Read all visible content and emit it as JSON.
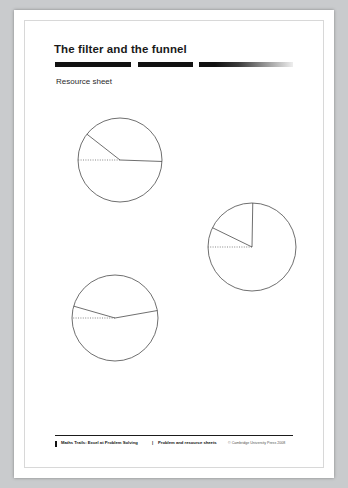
{
  "page": {
    "title": "The filter and the funnel",
    "subtitle": "Resource sheet"
  },
  "footer": {
    "left": "Maths Trails: Excel at Problem Solving",
    "separator": "|",
    "middle": "Problem and resource sheets",
    "right": "© Cambridge University Press 2008"
  },
  "diagram": {
    "stroke_color": "#4a4a4a",
    "dotted_color": "#555555",
    "circles": [
      {
        "name": "circle-top-left",
        "cx": 106,
        "cy": 150,
        "r": 42,
        "radius_lines": [
          {
            "name": "radius-upper-left",
            "angle_deg": 218,
            "style": "solid"
          },
          {
            "name": "radius-right",
            "angle_deg": 2,
            "style": "solid"
          },
          {
            "name": "radius-horizontal-dotted",
            "angle_deg": 180,
            "style": "dotted"
          }
        ]
      },
      {
        "name": "circle-middle-right",
        "cx": 238,
        "cy": 237,
        "r": 44,
        "radius_lines": [
          {
            "name": "radius-upper-left",
            "angle_deg": 206,
            "style": "solid"
          },
          {
            "name": "radius-up",
            "angle_deg": 271,
            "style": "solid"
          },
          {
            "name": "radius-horizontal-dotted",
            "angle_deg": 180,
            "style": "dotted"
          }
        ]
      },
      {
        "name": "circle-bottom-left",
        "cx": 101,
        "cy": 308,
        "r": 43,
        "radius_lines": [
          {
            "name": "radius-upper-left",
            "angle_deg": 196,
            "style": "solid"
          },
          {
            "name": "radius-right",
            "angle_deg": 350,
            "style": "solid"
          },
          {
            "name": "radius-horizontal-dotted",
            "angle_deg": 180,
            "style": "dotted"
          }
        ]
      }
    ]
  }
}
